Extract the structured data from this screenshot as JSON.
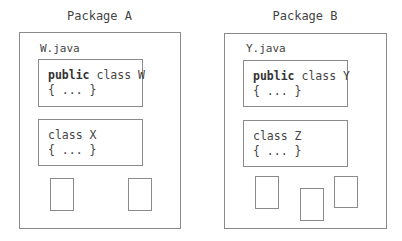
{
  "packages": [
    {
      "label": "Package A",
      "file": "W.java",
      "classes": [
        {
          "modifier": "public",
          "decl": " class W",
          "body": "{ ... }"
        },
        {
          "modifier": "",
          "decl": "class X",
          "body": "{ ... }"
        }
      ],
      "small_boxes": 2
    },
    {
      "label": "Package B",
      "file": "Y.java",
      "classes": [
        {
          "modifier": "public",
          "decl": " class Y",
          "body": "{ ... }"
        },
        {
          "modifier": "",
          "decl": "class Z",
          "body": "{ ... }"
        }
      ],
      "small_boxes": 3
    }
  ],
  "colors": {
    "border": "#8a8a8a",
    "text": "#444444"
  }
}
